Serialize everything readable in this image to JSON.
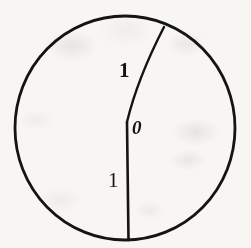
{
  "figure": {
    "kind": "geometry-diagram",
    "canvas": {
      "width": 251,
      "height": 248
    },
    "background_color": "#f7f6f3",
    "ink_color": "#141414",
    "circle": {
      "center_x": 125,
      "center_y": 128,
      "radius_x": 110,
      "radius_y": 112,
      "stroke_width": 2.8
    },
    "vertex": {
      "x": 127,
      "y": 122,
      "label": "0"
    },
    "segments": [
      {
        "name": "upper-slanted-segment",
        "from_x": 127,
        "from_y": 122,
        "to_x": 164,
        "to_y": 27,
        "label": "1",
        "stroke_width": 2.4
      },
      {
        "name": "lower-vertical-segment",
        "from_x": 127,
        "from_y": 122,
        "to_x": 128,
        "to_y": 240,
        "label": "1",
        "stroke_width": 2.4
      }
    ],
    "labels": {
      "upper_one": "1",
      "lower_one": "1",
      "vertex_zero": "0"
    }
  }
}
